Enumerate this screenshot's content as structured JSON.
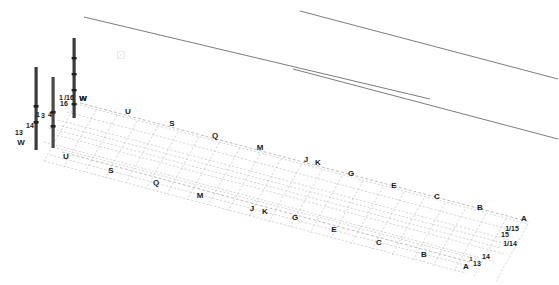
{
  "drawing": {
    "type": "isometric-structural-grid",
    "background_color": "#ffffff",
    "line_color_grid": "#b9b9b9",
    "line_color_ref": "#555555",
    "column_color": "#3c3c3c",
    "label_color": "#1a1a1a"
  },
  "columns": [
    {
      "id": "column-13W",
      "x": 36,
      "top": 67,
      "bottom": 150,
      "width": 3
    },
    {
      "id": "column-14",
      "x": 53,
      "top": 77,
      "bottom": 148,
      "width": 3
    },
    {
      "id": "column-16W",
      "x": 74,
      "top": 38,
      "bottom": 118,
      "width": 3
    }
  ],
  "column_nodes": [
    {
      "x": 36,
      "y": 106
    },
    {
      "x": 36,
      "y": 122
    },
    {
      "x": 53,
      "y": 112
    },
    {
      "x": 53,
      "y": 126
    },
    {
      "x": 74,
      "y": 58
    },
    {
      "x": 74,
      "y": 74
    },
    {
      "x": 74,
      "y": 90
    },
    {
      "x": 74,
      "y": 104
    }
  ],
  "reference_lines": [
    {
      "id": "ref-line-upper-left",
      "x1": 84,
      "y1": 18,
      "x2": 300,
      "y2": 68
    },
    {
      "id": "ref-line-upper-left-b",
      "x1": 300,
      "y1": 68,
      "x2": 428,
      "y2": 98
    },
    {
      "id": "ref-line-upper-right",
      "x1": 300,
      "y1": 12,
      "x2": 557,
      "y2": 82
    },
    {
      "id": "ref-line-lower-right",
      "x1": 290,
      "y1": 70,
      "x2": 557,
      "y2": 140
    }
  ],
  "grid_labels_top_row": [
    {
      "text": "W",
      "x": 83,
      "y": 99
    },
    {
      "text": "U",
      "x": 128,
      "y": 112
    },
    {
      "text": "S",
      "x": 172,
      "y": 124
    },
    {
      "text": "Q",
      "x": 215,
      "y": 136
    },
    {
      "text": "M",
      "x": 260,
      "y": 148
    },
    {
      "text": "J",
      "x": 306,
      "y": 160
    },
    {
      "text": "K",
      "x": 318,
      "y": 163
    },
    {
      "text": "G",
      "x": 351,
      "y": 174
    },
    {
      "text": "E",
      "x": 394,
      "y": 186
    },
    {
      "text": "C",
      "x": 437,
      "y": 197
    },
    {
      "text": "B",
      "x": 480,
      "y": 208
    },
    {
      "text": "A",
      "x": 524,
      "y": 219
    }
  ],
  "grid_labels_bottom_row": [
    {
      "text": "U",
      "x": 66,
      "y": 157
    },
    {
      "text": "S",
      "x": 111,
      "y": 171
    },
    {
      "text": "Q",
      "x": 156,
      "y": 183
    },
    {
      "text": "M",
      "x": 200,
      "y": 196
    },
    {
      "text": "J",
      "x": 252,
      "y": 209
    },
    {
      "text": "K",
      "x": 265,
      "y": 212
    },
    {
      "text": "G",
      "x": 295,
      "y": 218
    },
    {
      "text": "E",
      "x": 334,
      "y": 230
    },
    {
      "text": "C",
      "x": 379,
      "y": 243
    },
    {
      "text": "B",
      "x": 424,
      "y": 255
    },
    {
      "text": "A",
      "x": 466,
      "y": 267
    }
  ],
  "column_labels": [
    {
      "text": "13",
      "x": 19,
      "y": 132,
      "size": "small"
    },
    {
      "text": "W",
      "x": 21,
      "y": 143,
      "size": "normal"
    },
    {
      "text": "14",
      "x": 30,
      "y": 125,
      "size": "small"
    },
    {
      "text": "1",
      "x": 38,
      "y": 114,
      "size": "small"
    },
    {
      "text": "3",
      "x": 43,
      "y": 115,
      "size": "small"
    },
    {
      "text": "4",
      "x": 50,
      "y": 114,
      "size": "small"
    },
    {
      "text": "1",
      "x": 61,
      "y": 97,
      "size": "small"
    },
    {
      "text": "16",
      "x": 64,
      "y": 103,
      "size": "small"
    },
    {
      "text": "/16",
      "x": 69,
      "y": 97,
      "size": "small"
    },
    {
      "text": "W",
      "x": 83,
      "y": 99,
      "size": "normal"
    }
  ],
  "corner_labels": [
    {
      "text": "1/15",
      "x": 512,
      "y": 228,
      "size": "small"
    },
    {
      "text": "15",
      "x": 505,
      "y": 234,
      "size": "small"
    },
    {
      "text": "1/14",
      "x": 510,
      "y": 243,
      "size": "small"
    },
    {
      "text": "14",
      "x": 486,
      "y": 256,
      "size": "small"
    },
    {
      "text": "13",
      "x": 477,
      "y": 263,
      "size": "small"
    },
    {
      "text": "1",
      "x": 471,
      "y": 259,
      "size": "tiny"
    }
  ],
  "faint_mark": {
    "x": 121,
    "y": 55,
    "size": 7
  }
}
